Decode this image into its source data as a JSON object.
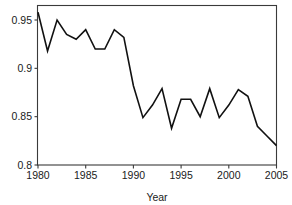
{
  "chart_data": {
    "type": "line",
    "title": "",
    "xlabel": "Year",
    "ylabel": "",
    "xlim": [
      1980,
      2005
    ],
    "ylim": [
      0.8,
      0.965
    ],
    "grid": false,
    "legend": null,
    "xticks": [
      1980,
      1985,
      1990,
      1995,
      2000,
      2005
    ],
    "xtick_labels": [
      "1980",
      "1985",
      "1990",
      "1995",
      "2000",
      "2005"
    ],
    "yticks": [
      0.8,
      0.85,
      0.9,
      0.95
    ],
    "ytick_labels": [
      "0.8",
      "0.85",
      "0.9",
      "0.95"
    ],
    "series": [
      {
        "name": "value",
        "color": "#111111",
        "x": [
          1980,
          1981,
          1982,
          1983,
          1984,
          1985,
          1986,
          1987,
          1988,
          1989,
          1990,
          1991,
          1992,
          1993,
          1994,
          1995,
          1996,
          1997,
          1998,
          1999,
          2000,
          2001,
          2002,
          2003,
          2004,
          2005
        ],
        "values": [
          0.958,
          0.918,
          0.95,
          0.935,
          0.93,
          0.94,
          0.92,
          0.92,
          0.94,
          0.932,
          0.882,
          0.849,
          0.862,
          0.879,
          0.838,
          0.868,
          0.868,
          0.85,
          0.879,
          0.849,
          0.862,
          0.878,
          0.871,
          0.84,
          0.83,
          0.82
        ]
      }
    ]
  },
  "axis": {
    "x_title": "Year"
  }
}
